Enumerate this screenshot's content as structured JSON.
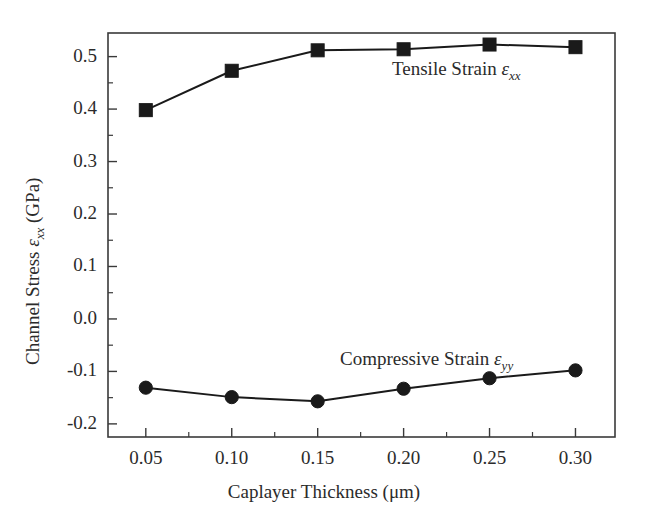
{
  "chart_data": {
    "type": "line",
    "title": "",
    "xlabel": "Caplayer Thickness (μm)",
    "ylabel_prefix": "Channel Stress ",
    "ylabel_symbol": "ε",
    "ylabel_sub": "xx",
    "ylabel_suffix": " (GPa)",
    "ylabel_full": "Channel Stress εxx (GPa)",
    "x": [
      0.05,
      0.1,
      0.15,
      0.2,
      0.25,
      0.3
    ],
    "xtick_labels": [
      "0.05",
      "0.10",
      "0.15",
      "0.20",
      "0.25",
      "0.30"
    ],
    "ytick_labels": [
      "0.5",
      "0.4",
      "0.3",
      "0.2",
      "0.1",
      "0.0",
      "-0.1",
      "-0.2"
    ],
    "ytick_values": [
      0.5,
      0.4,
      0.3,
      0.2,
      0.1,
      0.0,
      -0.1,
      -0.2
    ],
    "xlim": [
      0.028,
      0.323
    ],
    "ylim": [
      -0.225,
      0.545
    ],
    "grid": false,
    "legend_position": "inline-annotation",
    "minor_ticks": true,
    "series": [
      {
        "name": "Tensile Strain εxx",
        "label_prefix": "Tensile Strain ",
        "label_symbol": "ε",
        "label_sub": "xx",
        "marker": "square",
        "color": "#1a1a1a",
        "values": [
          0.398,
          0.473,
          0.512,
          0.514,
          0.523,
          0.518
        ]
      },
      {
        "name": "Compressive Strain εyy",
        "label_prefix": "Compressive Strain ",
        "label_symbol": "ε",
        "label_sub": "yy",
        "marker": "circle",
        "color": "#1a1a1a",
        "values": [
          -0.131,
          -0.149,
          -0.157,
          -0.133,
          -0.113,
          -0.098
        ]
      }
    ]
  },
  "axis": {
    "frame_color": "#3a3a3a"
  }
}
